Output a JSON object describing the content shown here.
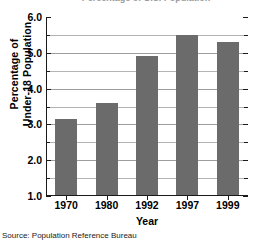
{
  "chart_data": {
    "type": "bar",
    "title": "Percentage of U.S. Population",
    "categories": [
      "1970",
      "1980",
      "1992",
      "1997",
      "1999"
    ],
    "values": [
      3.15,
      3.6,
      4.9,
      5.5,
      5.3
    ],
    "series": [
      {
        "name": "Percentage of Under-18 Population",
        "values": [
          3.15,
          3.6,
          4.9,
          5.5,
          5.3
        ]
      }
    ],
    "xlabel": "Year",
    "ylabel": "Percentage of Under-18 Population",
    "ylabel_lines": [
      "Percentage of",
      "Under-18 Population"
    ],
    "ylim": [
      1.0,
      6.0
    ],
    "ytick_values": [
      1.0,
      2.0,
      3.0,
      4.0,
      5.0,
      6.0
    ],
    "ytick_labels": [
      "1.0",
      "2.0",
      "3.0",
      "4.0",
      "5.0",
      "6.0"
    ],
    "yminor_step": 0.5,
    "grid": true,
    "grid_axis": "y",
    "legend": false,
    "legend_position": "none",
    "bar_color": "#6b6b6b",
    "gridline_color": "#b4b4b4",
    "axis_color": "#1a1a1a",
    "background_color": "#ffffff"
  },
  "footer": {
    "source_note": "Source: Population Reference Bureau"
  }
}
